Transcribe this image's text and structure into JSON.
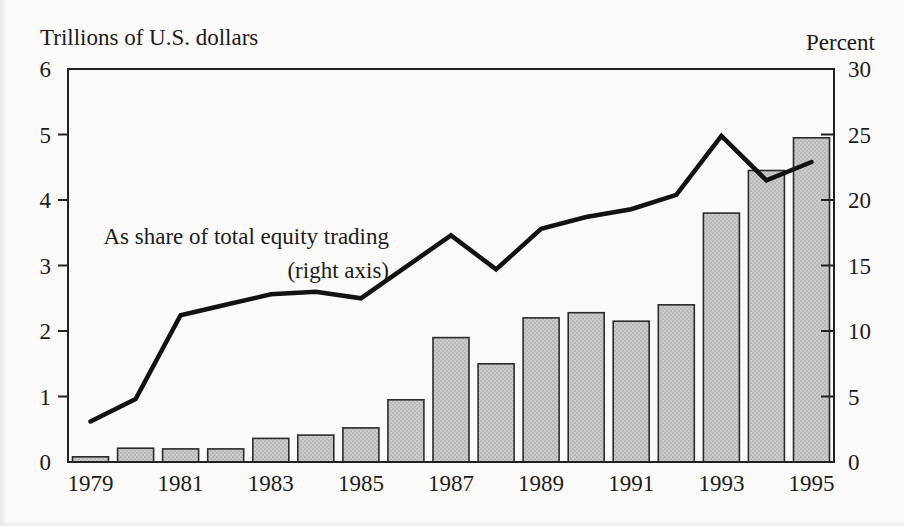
{
  "annotation": {
    "line1": "As share of total equity trading",
    "line2": "(right axis)"
  },
  "chart_data": {
    "type": "bar+line",
    "title": "",
    "categories": [
      1979,
      1980,
      1981,
      1982,
      1983,
      1984,
      1985,
      1986,
      1987,
      1988,
      1989,
      1990,
      1991,
      1992,
      1993,
      1994,
      1995
    ],
    "x_tick_labels": [
      "1979",
      "1981",
      "1983",
      "1985",
      "1987",
      "1989",
      "1991",
      "1993",
      "1995"
    ],
    "left_axis": {
      "label": "Trillions of U.S. dollars",
      "min": 0,
      "max": 6,
      "ticks": [
        0,
        1,
        2,
        3,
        4,
        5,
        6
      ]
    },
    "right_axis": {
      "label": "Percent",
      "min": 0,
      "max": 30,
      "ticks": [
        0,
        5,
        10,
        15,
        20,
        25,
        30
      ]
    },
    "series": [
      {
        "name": "Trillions of U.S. dollars",
        "type": "bar",
        "axis": "left",
        "values": [
          0.08,
          0.21,
          0.2,
          0.2,
          0.36,
          0.41,
          0.52,
          0.95,
          1.9,
          1.5,
          2.2,
          2.28,
          2.15,
          2.4,
          3.8,
          4.45,
          4.95
        ]
      },
      {
        "name": "As share of total equity trading (right axis)",
        "type": "line",
        "axis": "right",
        "values": [
          3.1,
          4.8,
          11.2,
          12.0,
          12.8,
          13.0,
          12.5,
          14.9,
          17.3,
          14.7,
          17.8,
          18.7,
          19.3,
          20.4,
          24.9,
          21.5,
          22.9
        ]
      }
    ],
    "grid": "off",
    "legend": "none (in-plot text annotation points to line)",
    "colors": {
      "bar_fill": "#cbcbca",
      "bar_dot": "#a3a3a2",
      "bar_border": "#2b2b2b",
      "line": "#121212",
      "frame": "#222222",
      "text": "#1b1b1b",
      "paper": "#fbfaf8"
    }
  }
}
